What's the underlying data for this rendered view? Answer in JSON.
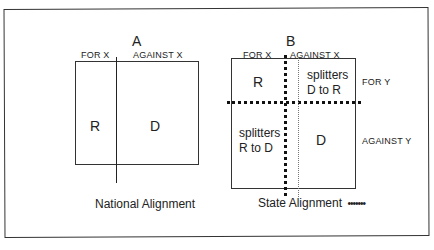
{
  "panel_a": {
    "letter": "A",
    "col_labels": [
      "FOR X",
      "AGAINST X"
    ],
    "cells": [
      "R",
      "D"
    ],
    "caption": "National Alignment"
  },
  "panel_b": {
    "letter": "B",
    "col_labels": [
      "FOR X",
      "AGAINST X"
    ],
    "row_labels": [
      "FOR Y",
      "AGAINST Y"
    ],
    "cells": {
      "top_left": "R",
      "top_right_line1": "splitters",
      "top_right_line2": "D to R",
      "bottom_left_line1": "splitters",
      "bottom_left_line2": "R to D",
      "bottom_right": "D"
    },
    "caption": "State Alignment",
    "legend_symbol": "•••••••"
  }
}
